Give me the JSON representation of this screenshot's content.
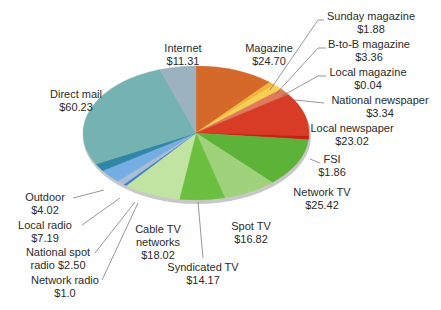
{
  "chart_data": {
    "type": "pie",
    "title": "",
    "units": "$",
    "start": "top",
    "direction": "clockwise",
    "slices": [
      {
        "name": "Magazine",
        "value": 24.7,
        "label_lines": [
          "Magazine",
          "$24.70"
        ],
        "color": "#d4692a"
      },
      {
        "name": "Sunday magazine",
        "value": 1.88,
        "label_lines": [
          "Sunday magazine",
          "$1.88"
        ],
        "color": "#f2b53b"
      },
      {
        "name": "B-to-B magazine",
        "value": 3.36,
        "label_lines": [
          "B-to-B magazine",
          "$3.36"
        ],
        "color": "#f7cf55"
      },
      {
        "name": "Local magazine",
        "value": 0.04,
        "label_lines": [
          "Local magazine",
          "$0.04"
        ],
        "color": "#e8a04a"
      },
      {
        "name": "National newspaper",
        "value": 3.34,
        "label_lines": [
          "National newspaper",
          "$3.34"
        ],
        "color": "#e07a5a"
      },
      {
        "name": "Local newspaper",
        "value": 23.02,
        "label_lines": [
          "Local newspaper",
          "$23.02"
        ],
        "color": "#d83b26"
      },
      {
        "name": "FSI",
        "value": 1.86,
        "label_lines": [
          "FSI",
          "$1.86"
        ],
        "color": "#c81e14"
      },
      {
        "name": "Network TV",
        "value": 25.42,
        "label_lines": [
          "Network TV",
          "$25.42"
        ],
        "color": "#5db337"
      },
      {
        "name": "Spot TV",
        "value": 16.82,
        "label_lines": [
          "Spot TV",
          "$16.82"
        ],
        "color": "#9fd27a"
      },
      {
        "name": "Syndicated TV",
        "value": 14.17,
        "label_lines": [
          "Syndicated TV",
          "$14.17"
        ],
        "color": "#6cc040"
      },
      {
        "name": "Cable TV networks",
        "value": 18.02,
        "label_lines": [
          "Cable TV",
          "networks",
          "$18.02"
        ],
        "color": "#c2e4a2"
      },
      {
        "name": "Network radio",
        "value": 1.0,
        "label_lines": [
          "Network radio",
          "$1.0"
        ],
        "color": "#3f7fc9"
      },
      {
        "name": "National spot radio",
        "value": 2.5,
        "label_lines": [
          "National spot",
          "radio $2.50"
        ],
        "color": "#a9bdd4"
      },
      {
        "name": "Local radio",
        "value": 7.19,
        "label_lines": [
          "Local radio",
          "$7.19"
        ],
        "color": "#74aee2"
      },
      {
        "name": "Outdoor",
        "value": 4.02,
        "label_lines": [
          "Outdoor",
          "$4.02"
        ],
        "color": "#2e87a8"
      },
      {
        "name": "Direct mail",
        "value": 60.23,
        "label_lines": [
          "Direct mail",
          "$60.23"
        ],
        "color": "#74b3b1"
      },
      {
        "name": "Internet",
        "value": 11.31,
        "label_lines": [
          "Internet",
          "$11.31"
        ],
        "color": "#9db2c1"
      }
    ],
    "rim_color": "#c8c8c8"
  }
}
